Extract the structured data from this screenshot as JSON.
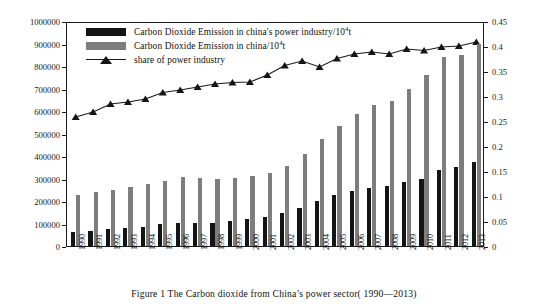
{
  "figure": {
    "caption": "Figure 1    The Carbon dioxide from China’s power sector( 1990—2013)"
  },
  "legend": {
    "items": [
      {
        "label": "Carbon Dioxide Emission in china's power industry/10",
        "sup": "4",
        "tail": "t",
        "swatch": "black-square",
        "color": "#141414"
      },
      {
        "label": "Carbon Dioxide Emission in china/10",
        "sup": "4",
        "tail": "t",
        "swatch": "gray-square",
        "color": "#7d7d7d"
      },
      {
        "label": "share of power industry",
        "sup": "",
        "tail": "",
        "swatch": "line-triangle-marker",
        "color": "#141414"
      }
    ]
  },
  "axes": {
    "left_ticks": [
      "0",
      "100000",
      "200000",
      "300000",
      "400000",
      "500000",
      "600000",
      "700000",
      "800000",
      "900000",
      "1000000"
    ],
    "right_ticks": [
      "0",
      "0.05",
      "0.1",
      "0.15",
      "0.2",
      "0.25",
      "0.3",
      "0.35",
      "0.4",
      "0.45"
    ]
  },
  "chart_data": {
    "type": "bar",
    "title": "",
    "subtitle": "",
    "xlabel": "",
    "ylabel": "",
    "y2label": "",
    "ylim": [
      0,
      1000000
    ],
    "y2lim": [
      0,
      0.45
    ],
    "grid": false,
    "legend_position": "top-left",
    "categories": [
      "1990",
      "1991",
      "1992",
      "1993",
      "1994",
      "1995",
      "1996",
      "1997",
      "1998",
      "1999",
      "2000",
      "2001",
      "2002",
      "2003",
      "2004",
      "2005",
      "2006",
      "2007",
      "2008",
      "2009",
      "2010",
      "2011",
      "2012",
      "2013"
    ],
    "series": [
      {
        "name": "Carbon Dioxide Emission in china's power industry/10^4 t",
        "type": "bar",
        "axis": "left",
        "color": "#141414",
        "values": [
          62000,
          68000,
          75000,
          82000,
          86000,
          96000,
          101000,
          103000,
          104000,
          110000,
          118000,
          128000,
          146000,
          170000,
          198000,
          228000,
          243000,
          258000,
          265000,
          285000,
          300000,
          340000,
          353000,
          372000
        ]
      },
      {
        "name": "Carbon Dioxide Emission in china/10^4 t",
        "type": "bar",
        "axis": "left",
        "color": "#7d7d7d",
        "values": [
          228000,
          239000,
          249000,
          262000,
          275000,
          290000,
          306000,
          302000,
          300000,
          304000,
          312000,
          326000,
          354000,
          411000,
          474000,
          534000,
          585000,
          625000,
          646000,
          700000,
          760000,
          838000,
          850000,
          900000
        ]
      },
      {
        "name": "share of power industry",
        "type": "line",
        "axis": "right",
        "color": "#141414",
        "marker": "triangle",
        "values": [
          0.262,
          0.272,
          0.288,
          0.292,
          0.298,
          0.311,
          0.316,
          0.322,
          0.328,
          0.331,
          0.332,
          0.346,
          0.365,
          0.374,
          0.362,
          0.379,
          0.388,
          0.392,
          0.388,
          0.398,
          0.395,
          0.402,
          0.404,
          0.412
        ]
      }
    ]
  }
}
